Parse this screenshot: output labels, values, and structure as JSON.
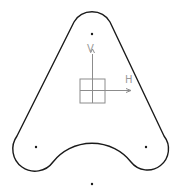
{
  "sketch": {
    "profile_color": "#1a1a1a",
    "axis_color": "#8c8c8c",
    "axes": {
      "horizontal_label": "H",
      "vertical_label": "V"
    },
    "points": [
      {
        "name": "top-center",
        "x": 92,
        "y": 34
      },
      {
        "name": "left-center",
        "x": 36,
        "y": 147
      },
      {
        "name": "right-center",
        "x": 146,
        "y": 147
      },
      {
        "name": "bottom-center",
        "x": 92,
        "y": 184
      }
    ]
  }
}
